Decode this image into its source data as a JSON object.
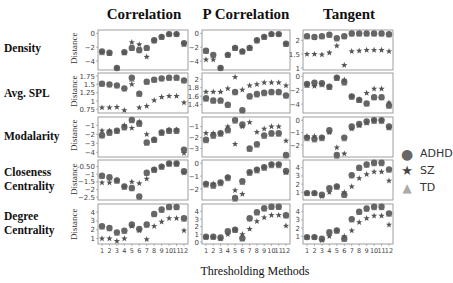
{
  "column_titles": [
    "Correlation",
    "P Correlation",
    "Tangent"
  ],
  "row_labels": [
    [
      "Density"
    ],
    [
      "Avg. SPL"
    ],
    [
      "Modalarity"
    ],
    [
      "Closeness",
      "Centrality"
    ],
    [
      "Degree",
      "Centrality"
    ]
  ],
  "y_axis_label": "Distance",
  "x_axis_label": "Thresholding Methods",
  "x_ticks": [
    "1",
    "2",
    "3",
    "4",
    "5",
    "6",
    "7",
    "8",
    "9",
    "10",
    "11",
    "12"
  ],
  "legend": [
    {
      "label": "ADHD",
      "marker": "circle"
    },
    {
      "label": "SZ",
      "marker": "star"
    },
    {
      "label": "TD",
      "marker": "triangle"
    }
  ],
  "colors": {
    "ADHD": "#666666",
    "SZ": "#555555",
    "TD": "#999999",
    "axis": "#888888"
  },
  "chart_data": {
    "type": "scatter",
    "title": "",
    "xlabel": "Thresholding Methods",
    "ylabel": "Distance",
    "categories": [
      1,
      2,
      3,
      4,
      5,
      6,
      7,
      8,
      9,
      10,
      11,
      12
    ],
    "panels": [
      {
        "row": "Density",
        "col": "Correlation",
        "ylim": [
          -5,
          0.2
        ],
        "yticks": [
          0,
          -2,
          -4
        ],
        "series": [
          {
            "name": "ADHD",
            "values": [
              -2.6,
              -2.8,
              -5.0,
              -2.7,
              -2.1,
              -2.4,
              -2.1,
              -1.0,
              -0.5,
              -0.1,
              -0.1,
              -1.4
            ]
          },
          {
            "name": "SZ",
            "values": [
              -2.7,
              -2.9,
              -5.0,
              -2.8,
              -1.3,
              -1.6,
              -3.4,
              -1.0,
              -0.5,
              -0.1,
              -0.1,
              -1.5
            ]
          },
          {
            "name": "TD",
            "values": [
              -2.8,
              -2.9,
              -5.0,
              -2.8,
              -2.2,
              -2.5,
              -2.2,
              -1.1,
              -0.6,
              -0.1,
              -0.1,
              -1.6
            ]
          }
        ]
      },
      {
        "row": "Density",
        "col": "P Correlation",
        "ylim": [
          -5,
          0.2
        ],
        "yticks": [
          0,
          -2,
          -4
        ],
        "series": [
          {
            "name": "ADHD",
            "values": [
              -2.5,
              -3.1,
              -5.0,
              -3.1,
              -2.1,
              -2.6,
              -2.1,
              -1.0,
              -0.5,
              -0.1,
              -0.1,
              -1.5
            ]
          },
          {
            "name": "SZ",
            "values": [
              -3.8,
              -3.8,
              -5.0,
              -3.1,
              -2.1,
              -2.6,
              -2.1,
              -1.0,
              -0.5,
              -0.1,
              -0.1,
              -1.5
            ]
          },
          {
            "name": "TD",
            "values": [
              -2.6,
              -3.2,
              -5.0,
              -3.2,
              -2.2,
              -2.7,
              -2.2,
              -1.1,
              -0.6,
              -0.1,
              -0.1,
              -1.6
            ]
          }
        ]
      },
      {
        "row": "Density",
        "col": "Tangent",
        "ylim": [
          1.0,
          2.3
        ],
        "yticks": [
          2.0,
          1.5,
          1.0
        ],
        "series": [
          {
            "name": "ADHD",
            "values": [
              2.15,
              2.12,
              2.15,
              2.2,
              2.08,
              2.15,
              2.25,
              2.25,
              2.25,
              2.25,
              2.25,
              2.22
            ]
          },
          {
            "name": "SZ",
            "values": [
              1.5,
              1.5,
              1.48,
              1.55,
              1.8,
              1.1,
              1.6,
              1.62,
              1.65,
              1.65,
              1.65,
              1.6
            ]
          },
          {
            "name": "TD",
            "values": [
              2.13,
              2.1,
              2.13,
              2.18,
              2.05,
              2.13,
              2.23,
              2.23,
              2.23,
              2.23,
              2.23,
              2.2
            ]
          }
        ]
      },
      {
        "row": "Avg. SPL",
        "col": "Correlation",
        "ylim": [
          0.7,
          1.78
        ],
        "yticks": [
          1.75,
          1.5,
          1.25,
          1.0,
          0.75
        ],
        "series": [
          {
            "name": "ADHD",
            "values": [
              1.52,
              1.5,
              1.47,
              1.38,
              1.7,
              1.22,
              1.58,
              1.64,
              1.68,
              1.7,
              1.7,
              1.62
            ]
          },
          {
            "name": "SZ",
            "values": [
              0.8,
              0.8,
              0.82,
              0.72,
              1.5,
              0.8,
              0.85,
              1.02,
              1.12,
              1.15,
              1.15,
              0.95
            ]
          },
          {
            "name": "TD",
            "values": [
              1.5,
              1.48,
              1.45,
              1.36,
              1.65,
              1.2,
              1.56,
              1.62,
              1.66,
              1.68,
              1.68,
              1.6
            ]
          }
        ]
      },
      {
        "row": "Avg. SPL",
        "col": "P Correlation",
        "ylim": [
          1.25,
          2.1
        ],
        "yticks": [
          2.0,
          1.8,
          1.6,
          1.4
        ],
        "series": [
          {
            "name": "ADHD",
            "values": [
              1.55,
              1.5,
              1.5,
              1.4,
              1.7,
              1.27,
              1.6,
              1.65,
              1.68,
              1.7,
              1.7,
              1.62
            ]
          },
          {
            "name": "SZ",
            "values": [
              1.7,
              1.7,
              1.7,
              1.78,
              2.05,
              1.75,
              1.85,
              1.88,
              1.92,
              1.92,
              1.92,
              1.85
            ]
          },
          {
            "name": "TD",
            "values": [
              1.53,
              1.48,
              1.48,
              1.38,
              1.68,
              1.25,
              1.58,
              1.63,
              1.66,
              1.68,
              1.68,
              1.6
            ]
          }
        ]
      },
      {
        "row": "Avg. SPL",
        "col": "Tangent",
        "ylim": [
          -5,
          0.2
        ],
        "yticks": [
          0,
          -2,
          -4
        ],
        "series": [
          {
            "name": "ADHD",
            "values": [
              -1.1,
              -0.9,
              -1.0,
              -1.5,
              -0.2,
              -0.8,
              -2.9,
              -3.4,
              -3.9,
              -3.0,
              -3.0,
              -4.2
            ]
          },
          {
            "name": "SZ",
            "values": [
              -1.2,
              -1.4,
              -1.1,
              -1.5,
              -0.2,
              -0.5,
              -2.9,
              -3.4,
              -2.4,
              -1.8,
              -1.8,
              -3.8
            ]
          },
          {
            "name": "TD",
            "values": [
              -1.3,
              -1.1,
              -1.2,
              -1.6,
              -0.3,
              -1.0,
              -3.0,
              -3.5,
              -4.0,
              -3.1,
              -3.1,
              -4.3
            ]
          }
        ]
      },
      {
        "row": "Modalarity",
        "col": "Correlation",
        "ylim": [
          -4.3,
          -0.3
        ],
        "yticks": [
          -1,
          -2,
          -3,
          -4
        ],
        "series": [
          {
            "name": "ADHD",
            "values": [
              -2.1,
              -1.8,
              -1.6,
              -1.2,
              -0.4,
              -0.8,
              -2.9,
              -2.6,
              -1.8,
              -1.6,
              -1.6,
              -3.7
            ]
          },
          {
            "name": "SZ",
            "values": [
              -1.6,
              -1.6,
              -1.6,
              -1.0,
              -1.3,
              -0.6,
              -2.0,
              -2.6,
              -1.8,
              -1.5,
              -1.5,
              -4.1
            ]
          },
          {
            "name": "TD",
            "values": [
              -2.2,
              -1.9,
              -1.7,
              -1.3,
              -0.5,
              -0.9,
              -3.0,
              -2.7,
              -1.9,
              -1.7,
              -1.7,
              -3.8
            ]
          }
        ]
      },
      {
        "row": "Modalarity",
        "col": "P Correlation",
        "ylim": [
          -3.6,
          -0.3
        ],
        "yticks": [
          -1,
          -2,
          -3
        ],
        "series": [
          {
            "name": "ADHD",
            "values": [
              -2.2,
              -1.8,
              -1.6,
              -1.3,
              -0.4,
              -0.8,
              -3.0,
              -2.6,
              -1.8,
              -1.6,
              -1.6,
              -3.6
            ]
          },
          {
            "name": "SZ",
            "values": [
              -1.6,
              -1.6,
              -1.6,
              -1.0,
              -2.6,
              -1.0,
              -0.6,
              -1.5,
              -1.2,
              -1.0,
              -1.0,
              -2.3
            ]
          },
          {
            "name": "TD",
            "values": [
              -2.3,
              -1.9,
              -1.7,
              -1.4,
              -0.5,
              -0.9,
              -3.1,
              -2.7,
              -1.9,
              -1.7,
              -1.7,
              -3.7
            ]
          }
        ]
      },
      {
        "row": "Modalarity",
        "col": "Tangent",
        "ylim": [
          -2.8,
          0.1
        ],
        "yticks": [
          0,
          -1,
          -2
        ],
        "series": [
          {
            "name": "ADHD",
            "values": [
              -1.4,
              -1.5,
              -1.4,
              -0.8,
              -2.8,
              -1.4,
              -0.5,
              -0.3,
              -0.1,
              0.0,
              0.0,
              -0.5
            ]
          },
          {
            "name": "SZ",
            "values": [
              -1.3,
              -1.3,
              -1.4,
              -1.0,
              -2.2,
              -2.7,
              -0.7,
              -0.4,
              -0.2,
              0.0,
              0.0,
              -0.6
            ]
          },
          {
            "name": "TD",
            "values": [
              -1.5,
              -1.6,
              -1.5,
              -0.9,
              -2.9,
              -1.5,
              -0.6,
              -0.4,
              -0.2,
              -0.1,
              -0.1,
              -0.6
            ]
          }
        ]
      },
      {
        "row": "Closeness Centrality",
        "col": "Correlation",
        "ylim": [
          -2.55,
          -0.2
        ],
        "yticks": [
          -0.5,
          -1.0,
          -1.5,
          -2.0,
          -2.5
        ],
        "series": [
          {
            "name": "ADHD",
            "values": [
              -1.1,
              -1.2,
              -1.4,
              -1.8,
              -1.9,
              -2.45,
              -0.9,
              -0.7,
              -0.5,
              -0.3,
              -0.3,
              -0.8
            ]
          },
          {
            "name": "SZ",
            "values": [
              -1.55,
              -1.55,
              -1.4,
              -1.8,
              -1.5,
              -1.6,
              -1.3,
              -0.7,
              -0.5,
              -0.3,
              -0.3,
              -0.9
            ]
          },
          {
            "name": "TD",
            "values": [
              -1.15,
              -1.25,
              -1.45,
              -1.85,
              -1.95,
              -2.5,
              -0.95,
              -0.75,
              -0.55,
              -0.35,
              -0.35,
              -0.85
            ]
          }
        ]
      },
      {
        "row": "Closeness Centrality",
        "col": "P Correlation",
        "ylim": [
          -2.7,
          0.1
        ],
        "yticks": [
          0,
          -1,
          -2
        ],
        "series": [
          {
            "name": "ADHD",
            "values": [
              -1.6,
              -1.7,
              -1.5,
              -1.1,
              -2.7,
              -1.4,
              -0.7,
              -0.5,
              -0.3,
              -0.1,
              -0.1,
              -0.6
            ]
          },
          {
            "name": "SZ",
            "values": [
              -1.6,
              -1.6,
              -1.5,
              -1.1,
              -2.1,
              -2.4,
              -0.7,
              -0.5,
              -0.3,
              -0.1,
              -0.1,
              -0.7
            ]
          },
          {
            "name": "TD",
            "values": [
              -1.7,
              -1.8,
              -1.6,
              -1.2,
              -2.8,
              -1.5,
              -0.8,
              -0.6,
              -0.4,
              -0.2,
              -0.2,
              -0.7
            ]
          }
        ]
      },
      {
        "row": "Closeness Centrality",
        "col": "Tangent",
        "ylim": [
          0.3,
          4.7
        ],
        "yticks": [
          4,
          3,
          2,
          1
        ],
        "series": [
          {
            "name": "ADHD",
            "values": [
              0.9,
              0.9,
              0.7,
              1.5,
              1.7,
              0.7,
              3.1,
              4.0,
              4.4,
              4.6,
              4.6,
              3.8
            ]
          },
          {
            "name": "SZ",
            "values": [
              0.9,
              0.9,
              0.5,
              1.0,
              1.7,
              1.0,
              1.7,
              2.7,
              3.2,
              3.5,
              3.5,
              2.4
            ]
          },
          {
            "name": "TD",
            "values": [
              0.85,
              0.85,
              0.65,
              1.4,
              1.6,
              0.65,
              3.0,
              3.9,
              4.3,
              4.5,
              4.5,
              3.7
            ]
          }
        ]
      },
      {
        "row": "Degree Centrality",
        "col": "Correlation",
        "ylim": [
          0.6,
          4.7
        ],
        "yticks": [
          4,
          3,
          2,
          1
        ],
        "series": [
          {
            "name": "ADHD",
            "values": [
              2.4,
              2.2,
              1.7,
              1.9,
              2.6,
              2.1,
              2.6,
              3.8,
              4.3,
              4.6,
              4.6,
              3.3
            ]
          },
          {
            "name": "SZ",
            "values": [
              1.0,
              1.0,
              0.7,
              1.0,
              2.4,
              1.9,
              0.9,
              2.4,
              2.9,
              3.3,
              3.3,
              1.9
            ]
          },
          {
            "name": "TD",
            "values": [
              2.3,
              2.1,
              1.6,
              1.8,
              2.5,
              2.0,
              2.5,
              3.7,
              4.2,
              4.5,
              4.5,
              3.2
            ]
          }
        ]
      },
      {
        "row": "Degree Centrality",
        "col": "P Correlation",
        "ylim": [
          0,
          4.7
        ],
        "yticks": [
          4,
          3,
          2,
          1,
          0
        ],
        "series": [
          {
            "name": "ADHD",
            "values": [
              0.7,
              0.7,
              0.6,
              1.4,
              1.6,
              0.5,
              3.1,
              3.9,
              4.4,
              4.6,
              4.6,
              3.5
            ]
          },
          {
            "name": "SZ",
            "values": [
              0.6,
              0.6,
              0.4,
              1.0,
              1.6,
              1.0,
              1.7,
              2.7,
              3.2,
              3.5,
              3.5,
              2.1
            ]
          },
          {
            "name": "TD",
            "values": [
              0.65,
              0.65,
              0.5,
              1.3,
              1.5,
              0.4,
              3.0,
              3.8,
              4.3,
              4.5,
              4.5,
              3.4
            ]
          }
        ]
      },
      {
        "row": "Degree Centrality",
        "col": "Tangent",
        "ylim": [
          0.3,
          4.7
        ],
        "yticks": [
          4,
          3,
          2,
          1
        ],
        "series": [
          {
            "name": "ADHD",
            "values": [
              0.9,
              0.9,
              0.7,
              1.5,
              1.7,
              0.7,
              3.1,
              4.0,
              4.4,
              4.6,
              4.6,
              3.8
            ]
          },
          {
            "name": "SZ",
            "values": [
              0.9,
              0.9,
              0.5,
              1.0,
              1.7,
              1.0,
              1.7,
              2.7,
              3.2,
              3.5,
              3.5,
              2.4
            ]
          },
          {
            "name": "TD",
            "values": [
              0.85,
              0.85,
              0.65,
              1.4,
              1.6,
              0.65,
              3.0,
              3.9,
              4.3,
              4.5,
              4.5,
              3.7
            ]
          }
        ]
      }
    ]
  }
}
